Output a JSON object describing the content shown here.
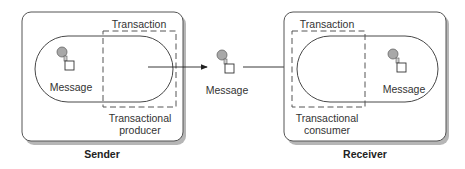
{
  "diagram": {
    "sender": {
      "caption": "Sender",
      "transaction_label": "Transaction",
      "role_line1": "Transactional",
      "role_line2": "producer",
      "message_label": "Message"
    },
    "middle": {
      "message_label": "Message"
    },
    "receiver": {
      "caption": "Receiver",
      "transaction_label": "Transaction",
      "role_line1": "Transactional",
      "role_line2": "consumer",
      "message_label": "Message"
    },
    "colors": {
      "box_border": "#555555",
      "shadow": "#888888",
      "line": "#333333",
      "dash": "#555555",
      "message_circle": "#a8a8a8"
    }
  }
}
